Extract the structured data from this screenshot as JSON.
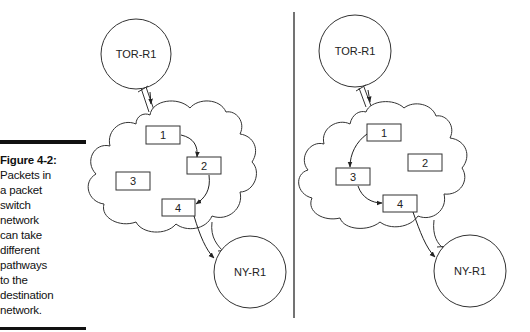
{
  "caption": {
    "title": "Figure 4-2:",
    "lines": [
      "Packets in",
      "a packet",
      "switch",
      "network",
      "can take",
      "different",
      "pathways",
      "to the",
      "destination",
      "network."
    ]
  },
  "left_panel": {
    "source_router": "TOR-R1",
    "destination_router": "NY-R1",
    "packets": [
      "1",
      "2",
      "3",
      "4"
    ],
    "path": [
      "1",
      "2",
      "4"
    ]
  },
  "right_panel": {
    "source_router": "TOR-R1",
    "destination_router": "NY-R1",
    "packets": [
      "1",
      "2",
      "3",
      "4"
    ],
    "path": [
      "1",
      "3",
      "4"
    ]
  },
  "colors": {
    "line": "#333333",
    "text": "#111111",
    "background": "#ffffff"
  }
}
